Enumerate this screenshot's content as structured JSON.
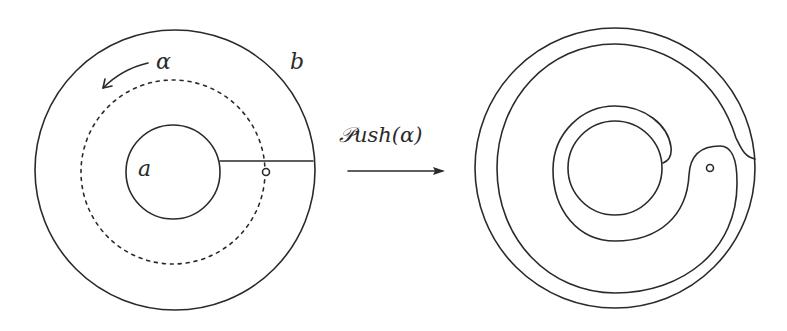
{
  "figure": {
    "type": "mapping-class push map diagram",
    "left_panel": {
      "outer_boundary_label": "b",
      "inner_boundary_label": "a",
      "loop_label": "α",
      "loop_style": "dashed",
      "elements": [
        "outer circle b",
        "inner circle a",
        "dashed loop α with counter-clockwise arrow",
        "radial arc from a to b",
        "marked point (puncture) on α"
      ]
    },
    "operator": {
      "label_script": "𝒫",
      "label_rest": "ush(α)",
      "arrow": "right"
    },
    "right_panel": {
      "elements": [
        "outer circle b",
        "inner circle a",
        "image of the radial arc after point-push along α",
        "marked point (puncture)"
      ]
    },
    "colors": {
      "ink": "#2a2a2a",
      "background": "#ffffff"
    }
  }
}
